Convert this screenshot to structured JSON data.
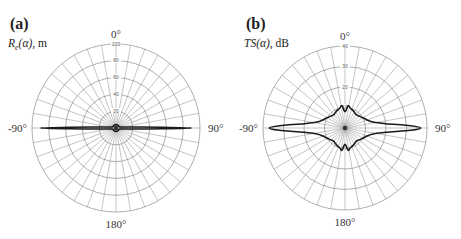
{
  "chart_data": [
    {
      "type": "polar",
      "panel": "(a)",
      "title": "",
      "ylabel": "R_e(α), m",
      "ylabel_symbol": "R",
      "ylabel_sub": "e",
      "ylabel_arg": "(α)",
      "ylabel_unit": ", m",
      "angle_labels": {
        "top": "0°",
        "right": "90°",
        "bottom": "180°",
        "left": "-90°"
      },
      "radial_ticks": [
        20,
        40,
        60,
        80,
        100
      ],
      "rlim": [
        0,
        100
      ],
      "spoke_step_deg": 10,
      "grid": true,
      "series": [
        {
          "name": "R_e(α)",
          "description": "narrow lobes along ±90°, near-zero elsewhere",
          "angles_deg": [
            0,
            30,
            60,
            75,
            80,
            84,
            87,
            89,
            90,
            91,
            93,
            96,
            100,
            105,
            120,
            150,
            180,
            210,
            240,
            255,
            260,
            264,
            267,
            269,
            270,
            271,
            273,
            276,
            280,
            285,
            300,
            330
          ],
          "values": [
            4,
            4,
            4,
            5,
            7,
            11,
            22,
            55,
            90,
            55,
            22,
            11,
            7,
            5,
            4,
            4,
            4,
            4,
            4,
            5,
            7,
            11,
            22,
            55,
            90,
            55,
            22,
            11,
            7,
            5,
            4,
            4
          ]
        }
      ]
    },
    {
      "type": "polar",
      "panel": "(b)",
      "title": "",
      "ylabel": "TS(α), dB",
      "ylabel_symbol": "TS",
      "ylabel_arg": "(α)",
      "ylabel_unit": ", dB",
      "angle_labels": {
        "top": "0°",
        "right": "90°",
        "bottom": "180°",
        "left": "-90°"
      },
      "radial_ticks": [
        10,
        20,
        30,
        40
      ],
      "rlim": [
        0,
        40
      ],
      "spoke_step_deg": 10,
      "grid": true,
      "series": [
        {
          "name": "TS(α)",
          "description": "broad lobes along ±90° with ripple near 0° and 180°",
          "angles_deg": [
            0,
            8,
            15,
            22,
            30,
            40,
            50,
            60,
            70,
            78,
            84,
            88,
            90,
            92,
            96,
            102,
            110,
            120,
            130,
            140,
            150,
            158,
            165,
            172,
            180,
            188,
            195,
            202,
            210,
            220,
            230,
            240,
            250,
            258,
            264,
            268,
            270,
            272,
            276,
            282,
            290,
            300,
            310,
            320,
            330,
            338,
            345,
            352
          ],
          "values": [
            8,
            11,
            10,
            9.5,
            9,
            8.5,
            9,
            10,
            11.5,
            14,
            20,
            32,
            37,
            32,
            20,
            14,
            11.5,
            10,
            9,
            8.5,
            9,
            9.5,
            10,
            11,
            8,
            11,
            10,
            9.5,
            9,
            8.5,
            9,
            10,
            11.5,
            14,
            20,
            32,
            37,
            32,
            20,
            14,
            11.5,
            10,
            9,
            8.5,
            9,
            9.5,
            10,
            11
          ]
        }
      ]
    }
  ]
}
